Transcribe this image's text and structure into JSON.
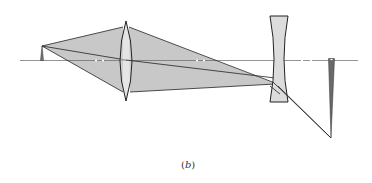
{
  "figure": {
    "caption_open": "(",
    "caption_letter": "b",
    "caption_close": ")",
    "type": "optical ray diagram",
    "elements": [
      {
        "name": "object-arrow",
        "label": "object"
      },
      {
        "name": "converging-lens",
        "label": "biconvex lens"
      },
      {
        "name": "diverging-lens",
        "label": "biconcave lens"
      },
      {
        "name": "image-arrow",
        "label": "inverted image"
      },
      {
        "name": "optical-axis",
        "label": "optical axis"
      }
    ]
  },
  "colors": {
    "ink": "#222222",
    "ray_fill": "#c8c8c8",
    "lens_fill": "#dcdcdc",
    "axis": "#555555",
    "image_fill": "#6a6a6a",
    "background": "#ffffff"
  }
}
